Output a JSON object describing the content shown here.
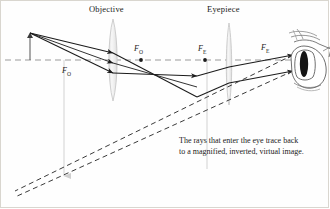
{
  "figure": {
    "type": "ray-diagram",
    "background_color": "#fefefe",
    "border_color": "#d9d6cf",
    "ink_color": "#1b1b1b",
    "lens_fill": "#eeeeee",
    "lens_stroke": "#c9c9c9",
    "axis_color": "#9a9a9a"
  },
  "labels": {
    "objective": "Objective",
    "eyepiece": "Eyepiece",
    "focal_objective_upper": "F",
    "focal_objective_upper_sub": "O",
    "focal_objective_lower": "F",
    "focal_objective_lower_sub": "O",
    "focal_eyepiece_left": "F",
    "focal_eyepiece_left_sub": "E",
    "focal_eyepiece_right": "F",
    "focal_eyepiece_right_sub": "E"
  },
  "caption": {
    "text": "The rays that enter the eye trace back to a magnified, inverted, virtual image."
  },
  "elements": {
    "object_arrow": "object-arrow",
    "optical_axis": "optical-axis",
    "eye": "human-eye",
    "solid_rays": 2,
    "dashed_extension_rays": 2,
    "image_marker_lines": 2
  }
}
